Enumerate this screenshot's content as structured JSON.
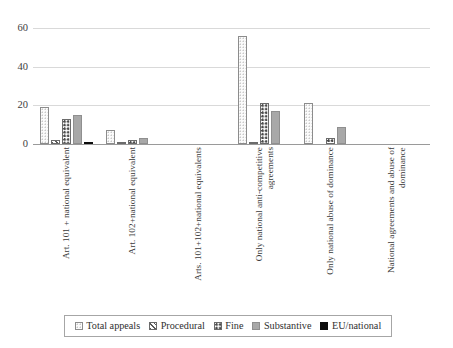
{
  "chart_data": {
    "type": "bar",
    "title": "",
    "subtitle": "",
    "xlabel": "",
    "ylabel": "",
    "ylim": [
      0,
      60
    ],
    "yticks": [
      0,
      20,
      40,
      60
    ],
    "ytick_labels": [
      "0",
      "20",
      "40",
      "60"
    ],
    "grid": true,
    "legend_position": "bottom",
    "categories": [
      "Art. 101 + national equivalent",
      "Art. 102+national equivalent",
      "Arts. 101+102+national equivalents",
      "Only national anti-competitive\nagreements",
      "Only national abuse of dominance",
      "National agreements and abuse of\ndominance"
    ],
    "series": [
      {
        "name": "Total appeals",
        "values": [
          19,
          7,
          0,
          56,
          21,
          0
        ]
      },
      {
        "name": "Procedural",
        "values": [
          2,
          1,
          0,
          1,
          0,
          0
        ]
      },
      {
        "name": "Fine",
        "values": [
          13,
          2,
          0,
          21,
          3,
          0
        ]
      },
      {
        "name": "Substantive",
        "values": [
          15,
          3,
          0,
          17,
          9,
          0
        ]
      },
      {
        "name": "EU/national",
        "values": [
          1,
          0,
          0,
          0,
          0,
          0
        ]
      }
    ]
  },
  "legend": {
    "items": [
      {
        "label": "Total appeals",
        "pattern": "dotted-light",
        "color": "#fbfbfb"
      },
      {
        "label": "Procedural",
        "pattern": "diagonal-hatch",
        "color": "#5a5a5a"
      },
      {
        "label": "Fine",
        "pattern": "polka-dot",
        "color": "#4a4a4a"
      },
      {
        "label": "Substantive",
        "pattern": "solid-gray",
        "color": "#a8a8a8"
      },
      {
        "label": "EU/national",
        "pattern": "solid-black",
        "color": "#0d0d0d"
      }
    ]
  },
  "axis": {
    "grid_color": "#d9d9d9",
    "baseline_color": "#9a9a9a",
    "tick_text_color": "#404040"
  }
}
